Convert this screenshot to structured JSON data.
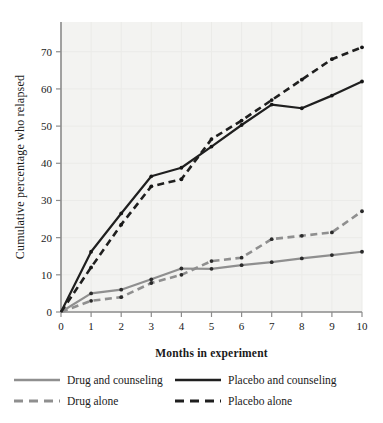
{
  "chart_data": {
    "type": "line",
    "title": "",
    "xlabel": "Months in experiment",
    "ylabel": "Cumulative percentage who relapsed",
    "x": [
      0,
      1,
      2,
      3,
      4,
      5,
      6,
      7,
      8,
      9,
      10
    ],
    "xticklabels": [
      "0",
      "1",
      "2",
      "3",
      "4",
      "5",
      "6",
      "7",
      "8",
      "9",
      "10"
    ],
    "yticklabels": [
      "0",
      "10",
      "20",
      "30",
      "40",
      "50",
      "60",
      "70"
    ],
    "yticks": [
      0,
      10,
      20,
      30,
      40,
      50,
      60,
      70
    ],
    "xlim": [
      0,
      10
    ],
    "ylim": [
      0,
      78
    ],
    "grid": true,
    "legend_position": "below-axes",
    "series": [
      {
        "name": "Drug and counseling",
        "color": "#8f8f8f",
        "style": "solid",
        "values": [
          0,
          5.0,
          6.0,
          8.8,
          11.7,
          11.6,
          12.6,
          13.4,
          14.4,
          15.3,
          16.2
        ]
      },
      {
        "name": "Drug alone",
        "color": "#8f8f8f",
        "style": "dashed",
        "values": [
          0,
          3.0,
          4.0,
          7.8,
          10.0,
          13.7,
          14.6,
          19.6,
          20.5,
          21.4,
          27.1
        ]
      },
      {
        "name": "Placebo and counseling",
        "color": "#1f1f1f",
        "style": "solid",
        "values": [
          0,
          16.2,
          26.5,
          36.5,
          38.8,
          44.5,
          50.3,
          55.8,
          54.8,
          58.2,
          62.0
        ]
      },
      {
        "name": "Placebo alone",
        "color": "#1f1f1f",
        "style": "dashed",
        "values": [
          0,
          12.0,
          23.5,
          33.8,
          35.7,
          46.5,
          51.5,
          57.0,
          62.5,
          68.0,
          71.2
        ]
      }
    ]
  },
  "legend": {
    "entries": [
      {
        "label": "Drug and counseling",
        "color": "#8f8f8f",
        "style": "solid"
      },
      {
        "label": "Placebo and counseling",
        "color": "#1f1f1f",
        "style": "solid"
      },
      {
        "label": "Drug alone",
        "color": "#8f8f8f",
        "style": "dashed"
      },
      {
        "label": "Placebo alone",
        "color": "#1f1f1f",
        "style": "dashed"
      }
    ]
  }
}
